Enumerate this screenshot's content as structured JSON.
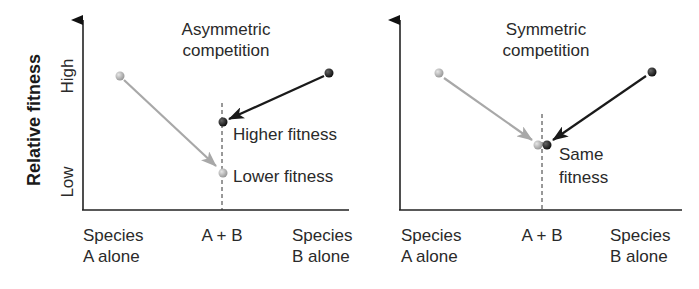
{
  "y_axis": {
    "label": "Relative fitness",
    "high_label": "High",
    "low_label": "Low"
  },
  "panels": [
    {
      "title_line1": "Asymmetric",
      "title_line2": "competition",
      "x_labels": [
        {
          "line1": "Species",
          "line2": "A alone"
        },
        {
          "line1": "A + B",
          "line2": ""
        },
        {
          "line1": "Species",
          "line2": "B alone"
        }
      ],
      "annotations": [
        {
          "line1": "Higher fitness",
          "line2": ""
        },
        {
          "line1": "Lower fitness",
          "line2": ""
        }
      ]
    },
    {
      "title_line1": "Symmetric",
      "title_line2": "competition",
      "x_labels": [
        {
          "line1": "Species",
          "line2": "A alone"
        },
        {
          "line1": "A + B",
          "line2": ""
        },
        {
          "line1": "Species",
          "line2": "B alone"
        }
      ],
      "annotations": [
        {
          "line1": "Same",
          "line2": "fitness"
        }
      ]
    }
  ],
  "colors": {
    "species_a": "#b0b0b0",
    "species_b": "#2a2a2a",
    "axis": "#222222"
  }
}
